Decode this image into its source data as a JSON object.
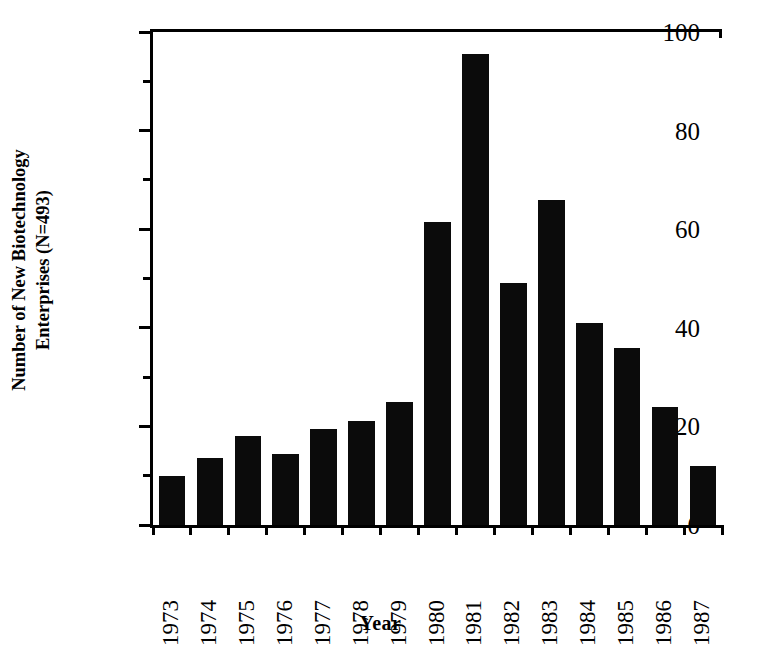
{
  "chart_data": {
    "type": "bar",
    "title": "",
    "xlabel": "Year",
    "ylabel": "Number of New Biotechnology Enterprises (N=493)",
    "ylabel_lines": [
      "Number of New Biotechnology",
      "Enterprises (N=493)"
    ],
    "categories": [
      "1973",
      "1974",
      "1975",
      "1976",
      "1977",
      "1978",
      "1979",
      "1980",
      "1981",
      "1982",
      "1983",
      "1984",
      "1985",
      "1986",
      "1987"
    ],
    "values": [
      10,
      13.5,
      18,
      14.5,
      19.5,
      21,
      25,
      61.5,
      95.5,
      49,
      66,
      41,
      36,
      24,
      12
    ],
    "ylim": [
      0,
      100
    ],
    "xlim_note": "categorical",
    "y_major_ticks": [
      0,
      20,
      40,
      60,
      80,
      100
    ],
    "y_minor_ticks": [
      10,
      30,
      50,
      70,
      90
    ],
    "y_tick_labels": [
      "0",
      "20",
      "40",
      "60",
      "80",
      "100"
    ],
    "grid": false,
    "legend": null,
    "bar_color": "#0b0b0b",
    "axis_color": "#000000",
    "background_color": "#ffffff",
    "total_note": "N=493"
  }
}
